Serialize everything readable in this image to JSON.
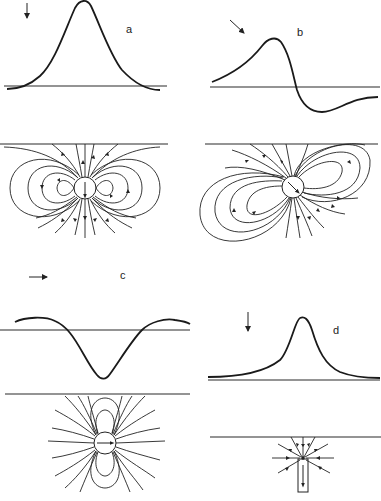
{
  "figure": {
    "panels": [
      {
        "label": "a",
        "field_direction": "vertical-down",
        "profile": "symmetric positive peak",
        "source": "dipole magnetized vertically (down)"
      },
      {
        "label": "b",
        "field_direction": "inclined-down-right",
        "profile": "asymmetric positive peak followed by negative trough",
        "source": "dipole magnetized at inclination"
      },
      {
        "label": "c",
        "field_direction": "horizontal-right",
        "profile": "central negative trough with positive flanks",
        "source": "dipole magnetized horizontally"
      },
      {
        "label": "d",
        "field_direction": "vertical-down",
        "profile": "sharp positive peak, no negative lobes",
        "source": "single pole at top of long vertical body"
      }
    ]
  },
  "colors": {
    "ink": "#1a1a1a",
    "background": "#ffffff"
  }
}
